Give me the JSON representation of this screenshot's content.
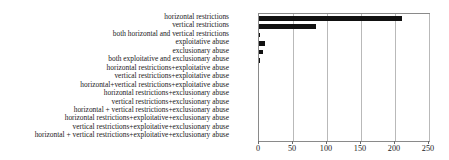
{
  "chart_data": {
    "type": "bar",
    "orientation": "horizontal",
    "title": "",
    "xlabel": "",
    "ylabel": "",
    "xlim": [
      0,
      250
    ],
    "xticks": [
      0,
      50,
      100,
      150,
      200,
      250
    ],
    "xtick_labels": [
      "0",
      "50",
      "100",
      "150",
      "200",
      "250"
    ],
    "grid": true,
    "grid_axis": "x",
    "legend": false,
    "bar_color": "#111111",
    "categories": [
      "horizontal restrictions",
      "vertical restrictions",
      "both horizontal and vertical restrictions",
      "exploitative abuse",
      "exclusionary abuse",
      "both exploitative and exclusionary abuse",
      "horizontal restrictions+exploitative abuse",
      "vertical restrictions+exploitative abuse",
      "horizontal+vertical restrictions+exploitative abuse",
      "horizontal restrictions+exclusionary abuse",
      "vertical restrictions+exclusionary abuse",
      "horizontal + vertical restrictions+exclusionary abuse",
      "horizontal restrictions+exploitative+exclusionary abuse",
      "vertical restrictions+exploitative+exclusionary abuse",
      "horizontal + vertical restrictions+exploitative+exclusionary abuse"
    ],
    "values": [
      211,
      84,
      2,
      9,
      6,
      1,
      0,
      0,
      0,
      0,
      0,
      0,
      0,
      0,
      0
    ]
  }
}
